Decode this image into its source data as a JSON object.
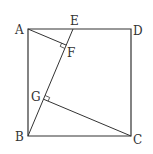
{
  "diagram": {
    "type": "geometry",
    "colors": {
      "stroke": "#333333",
      "background": "#ffffff"
    },
    "points": {
      "A": {
        "label": "A",
        "x": 28,
        "y": 29
      },
      "B": {
        "label": "B",
        "x": 28,
        "y": 136
      },
      "C": {
        "label": "C",
        "x": 131,
        "y": 136
      },
      "D": {
        "label": "D",
        "x": 131,
        "y": 29
      },
      "E": {
        "label": "E",
        "x": 73,
        "y": 29
      },
      "F": {
        "label": "F",
        "x": 66.2,
        "y": 45.1
      },
      "G": {
        "label": "G",
        "x": 43.5,
        "y": 99.2
      }
    },
    "segments": [
      "AB",
      "BC",
      "CD",
      "DA",
      "BE",
      "AF",
      "CG"
    ],
    "right_angles": [
      "AFB",
      "CGE"
    ]
  }
}
